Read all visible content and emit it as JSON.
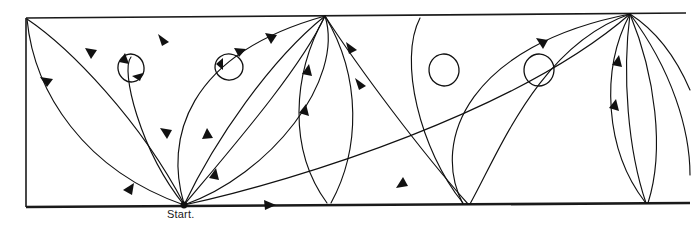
{
  "figure": {
    "kind": "geodesic-trajectory-diagram",
    "caption_label": "Start.",
    "caption_position": {
      "x": 167,
      "y": 208
    },
    "canvas": {
      "width": 692,
      "height": 235
    },
    "colors": {
      "background": "#ffffff",
      "stroke": "#111111",
      "frame": "#1a1a1a"
    },
    "frame": {
      "name": "slanted-band",
      "top_left": {
        "x": 26,
        "y": 18
      },
      "top_right": {
        "x": 686,
        "y": 13
      },
      "bottom_left": {
        "x": 26,
        "y": 207
      },
      "bottom_right": {
        "x": 690,
        "y": 203
      },
      "left_edge_width": 1.6,
      "top_edge_width": 1.7,
      "bottom_edge_width": 2.6
    },
    "vertices": {
      "bottom": [
        {
          "name": "start-vertex",
          "x": 184,
          "y": 205,
          "dot": true,
          "r": 3.4
        },
        {
          "name": "bottom-vertex-2",
          "x": 463,
          "y": 204,
          "dot": false
        },
        {
          "name": "bottom-vertex-3",
          "x": 470,
          "y": 204,
          "dot": false
        },
        {
          "name": "bottom-vertex-4",
          "x": 645,
          "y": 203,
          "dot": false
        }
      ],
      "top": [
        {
          "name": "top-vertex-left",
          "x": 27,
          "y": 18,
          "dot": false
        },
        {
          "name": "top-vertex-center",
          "x": 325,
          "y": 15,
          "dot": false
        },
        {
          "name": "top-vertex-right",
          "x": 630,
          "y": 13,
          "dot": false
        }
      ]
    },
    "loops": [
      {
        "name": "loop-1",
        "cx": 131,
        "cy": 68,
        "rx": 13,
        "ry": 14,
        "rotation": -12,
        "arrows": 2
      },
      {
        "name": "loop-2",
        "cx": 229,
        "cy": 67,
        "rx": 14,
        "ry": 13,
        "rotation": 8,
        "arrows": 2
      },
      {
        "name": "loop-3",
        "cx": 444,
        "cy": 70,
        "rx": 15,
        "ry": 16,
        "rotation": -6,
        "arrows": 0
      },
      {
        "name": "loop-4",
        "cx": 539,
        "cy": 70,
        "rx": 15,
        "ry": 16,
        "rotation": 4,
        "arrows": 0
      }
    ],
    "arrow_count": 14,
    "arc_count": 18
  }
}
